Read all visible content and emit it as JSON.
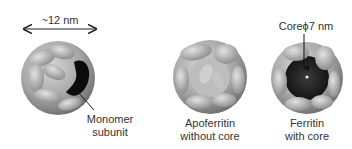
{
  "figure": {
    "scale_label": "~12 nm",
    "panels": [
      {
        "id": "ferritin-shell",
        "label_lines": [
          "Monomer",
          "subunit"
        ]
      },
      {
        "id": "apoferritin",
        "label_lines": [
          "Apoferritin",
          "without core"
        ]
      },
      {
        "id": "ferritin-core",
        "label_lines": [
          "Ferritin",
          "with core"
        ],
        "annotation": "Coreϕ7 nm"
      }
    ],
    "colors": {
      "shell": "#a8a8a8",
      "shell_dark": "#6e6e6e",
      "core": "#1a1a1a",
      "subunit_highlight": "#0a0a0a"
    }
  }
}
